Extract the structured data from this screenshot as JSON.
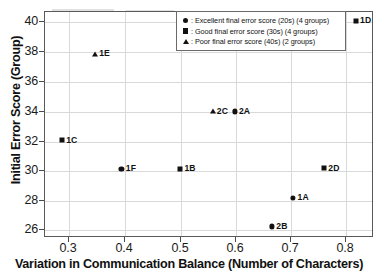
{
  "chart_data": {
    "type": "scatter",
    "title": "",
    "xlabel": "Variation in Communication Balance (Number of Characters)",
    "ylabel": "Initial Error Score (Group)",
    "xlim": [
      0.255,
      0.845
    ],
    "ylim": [
      25.2,
      40.9
    ],
    "xticks": [
      0.3,
      0.4,
      0.5,
      0.6,
      0.7,
      0.8
    ],
    "xticklabels": [
      "0.3",
      "0.4",
      "0.5",
      "0.6",
      "0.7",
      "0.8"
    ],
    "yticks": [
      26,
      28,
      30,
      32,
      34,
      36,
      38,
      40
    ],
    "yticklabels": [
      "26",
      "28",
      "30",
      "32",
      "34",
      "36",
      "38",
      "40"
    ],
    "grid": true,
    "legend_position": "upper right",
    "marker_color": "#111111",
    "grid_color": "#d9d9d9",
    "frame_color": "#5a5a5a",
    "series": [
      {
        "name": "Excellent final error score (20s) (4 groups)",
        "marker": "circle",
        "points": [
          {
            "label": "1F",
            "x": 0.392,
            "y": 30.0
          },
          {
            "label": "2A",
            "x": 0.595,
            "y": 34.0
          },
          {
            "label": "1A",
            "x": 0.7,
            "y": 28.0
          },
          {
            "label": "2B",
            "x": 0.662,
            "y": 26.0
          }
        ]
      },
      {
        "name": "Good final error score (30s) (4 groups)",
        "marker": "square",
        "points": [
          {
            "label": "1C",
            "x": 0.285,
            "y": 32.0
          },
          {
            "label": "1B",
            "x": 0.497,
            "y": 30.0
          },
          {
            "label": "2D",
            "x": 0.755,
            "y": 30.05
          },
          {
            "label": "1D",
            "x": 0.812,
            "y": 40.3
          }
        ]
      },
      {
        "name": "Poor final error score (40s) (2 groups)",
        "marker": "triangle",
        "points": [
          {
            "label": "1E",
            "x": 0.345,
            "y": 38.0
          },
          {
            "label": "2C",
            "x": 0.556,
            "y": 34.0
          }
        ]
      }
    ]
  },
  "legend": {
    "items": [
      {
        "marker": "circle",
        "text": ": Excellent final error score (20s) (4 groups)"
      },
      {
        "marker": "square",
        "text": ": Good final error score (30s) (4 groups)"
      },
      {
        "marker": "triangle",
        "text": ": Poor final error score (40s) (2 groups)"
      }
    ]
  }
}
